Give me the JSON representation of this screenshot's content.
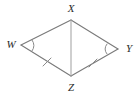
{
  "figure": {
    "name": "quadrilateral-wxyz-with-diagonal",
    "shape_type": "kite",
    "background_color": "#ffffff",
    "stroke_color": "#7a7a7a",
    "diagonal_color": "#a8a8a8",
    "mark_color": "#8a8a8a",
    "label_color": "#2b2b2b"
  },
  "vertices": [
    {
      "label": "X",
      "x": 71,
      "y": 20,
      "label_x": 71,
      "label_y": 9,
      "anchor": "middle"
    },
    {
      "label": "W",
      "x": 21,
      "y": 45,
      "label_x": 11,
      "label_y": 45,
      "anchor": "middle"
    },
    {
      "label": "Y",
      "x": 118,
      "y": 49,
      "label_x": 129,
      "label_y": 49,
      "anchor": "middle"
    },
    {
      "label": "Z",
      "x": 71,
      "y": 76,
      "label_x": 71,
      "label_y": 88,
      "anchor": "middle"
    }
  ],
  "segments": [
    {
      "name": "segment-wx",
      "from": "W",
      "to": "X",
      "x1": 21,
      "y1": 45,
      "x2": 71,
      "y2": 20,
      "style": "solid"
    },
    {
      "name": "segment-xy",
      "from": "X",
      "to": "Y",
      "x1": 71,
      "y1": 20,
      "x2": 118,
      "y2": 49,
      "style": "solid"
    },
    {
      "name": "segment-wz",
      "from": "W",
      "to": "Z",
      "x1": 21,
      "y1": 45,
      "x2": 71,
      "y2": 76,
      "style": "solid"
    },
    {
      "name": "segment-zy",
      "from": "Z",
      "to": "Y",
      "x1": 71,
      "y1": 76,
      "x2": 118,
      "y2": 49,
      "style": "solid"
    },
    {
      "name": "segment-xz-diagonal",
      "from": "X",
      "to": "Z",
      "x1": 71,
      "y1": 20,
      "x2": 71,
      "y2": 76,
      "style": "solid"
    }
  ],
  "tick_marks": [
    {
      "name": "tick-mark-wz",
      "on_segment": "segment-wz",
      "count": 1,
      "x1": 43,
      "y1": 66,
      "x2": 51,
      "y2": 58
    },
    {
      "name": "tick-mark-zy",
      "on_segment": "segment-zy",
      "count": 1,
      "x1": 89,
      "y1": 67,
      "x2": 97,
      "y2": 59
    }
  ],
  "angle_arcs": [
    {
      "name": "angle-arc-w",
      "at_vertex": "W",
      "count": 1,
      "path": "M 32 40 Q 36 45.5 32 51"
    },
    {
      "name": "angle-arc-y",
      "at_vertex": "Y",
      "count": 1,
      "path": "M 107 44 Q 103 49 107 54"
    }
  ]
}
